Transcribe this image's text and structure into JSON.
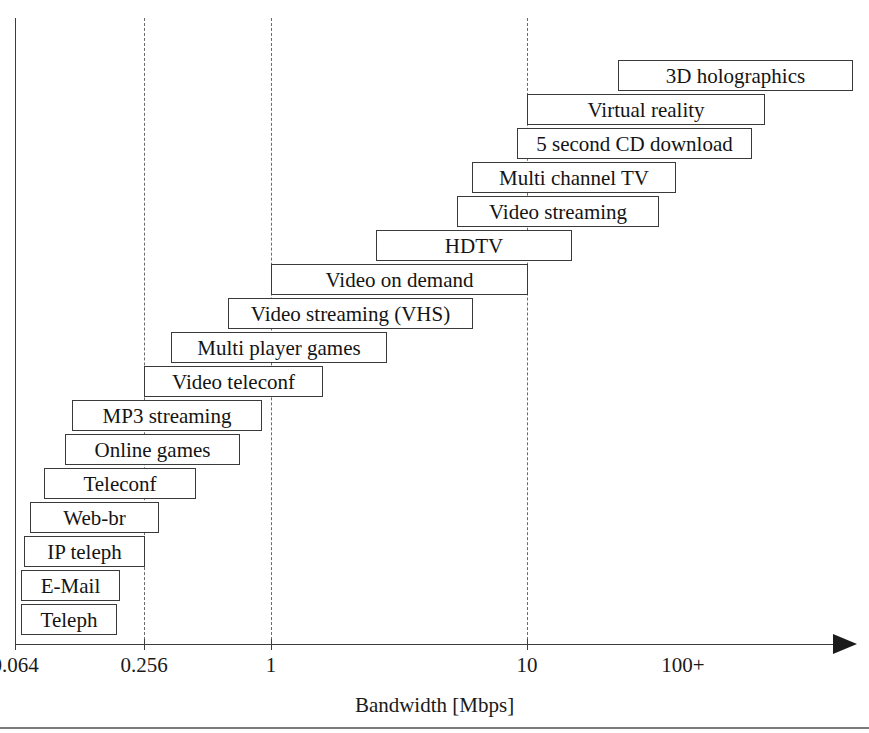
{
  "figure": {
    "title": "",
    "axis_title": "Bandwidth [Mbps]"
  },
  "axis": {
    "ticks": [
      {
        "label": "0.064",
        "x": 15,
        "gridline": false
      },
      {
        "label": "0.256",
        "x": 144,
        "gridline": true
      },
      {
        "label": "1",
        "x": 271,
        "gridline": true
      },
      {
        "label": "10",
        "x": 527,
        "gridline": true
      },
      {
        "label": "100+",
        "x": 683,
        "gridline": false
      }
    ]
  },
  "chart_data": {
    "type": "bar",
    "orientation": "horizontal-range",
    "title": "",
    "xlabel": "Bandwidth [Mbps]",
    "ylabel": "",
    "xscale": "log-categorical",
    "xticks": [
      "0.064",
      "0.256",
      "1",
      "10",
      "100+"
    ],
    "grid": "vertical-dashed at 0.256, 1, 10",
    "legend": "none",
    "categories": [
      "3D holographics",
      "Virtual reality",
      "5 second CD download",
      "Multi channel TV",
      "Video streaming",
      "HDTV",
      "Video on demand",
      "Video streaming (VHS)",
      "Multi player games",
      "Video teleconf",
      "MP3 streaming",
      "Online games",
      "Teleconf",
      "Web-br",
      "IP teleph",
      "E-Mail",
      "Teleph"
    ],
    "bars": [
      {
        "label": "3D holographics",
        "x": 618,
        "width": 235,
        "y": 60,
        "start_mbps": 25,
        "end_mbps": 130
      },
      {
        "label": "Virtual reality",
        "x": 527,
        "width": 238,
        "y": 94,
        "start_mbps": 10,
        "end_mbps": 60
      },
      {
        "label": "5 second CD download",
        "x": 517,
        "width": 235,
        "y": 128,
        "start_mbps": 9,
        "end_mbps": 50
      },
      {
        "label": "Multi channel TV",
        "x": 472,
        "width": 204,
        "y": 162,
        "start_mbps": 6,
        "end_mbps": 27
      },
      {
        "label": "Video streaming",
        "x": 457,
        "width": 202,
        "y": 196,
        "start_mbps": 5,
        "end_mbps": 23
      },
      {
        "label": "HDTV",
        "x": 376,
        "width": 196,
        "y": 230,
        "start_mbps": 2.3,
        "end_mbps": 13
      },
      {
        "label": "Video on demand",
        "x": 271,
        "width": 257,
        "y": 264,
        "start_mbps": 1,
        "end_mbps": 10
      },
      {
        "label": "Video streaming (VHS)",
        "x": 228,
        "width": 245,
        "y": 298,
        "start_mbps": 0.7,
        "end_mbps": 6
      },
      {
        "label": "Multi player games",
        "x": 171,
        "width": 216,
        "y": 332,
        "start_mbps": 0.4,
        "end_mbps": 2.6
      },
      {
        "label": "Video teleconf",
        "x": 144,
        "width": 179,
        "y": 366,
        "start_mbps": 0.256,
        "end_mbps": 1.5
      },
      {
        "label": "MP3 streaming",
        "x": 72,
        "width": 190,
        "y": 400,
        "start_mbps": 0.11,
        "end_mbps": 0.9
      },
      {
        "label": "Online games",
        "x": 65,
        "width": 175,
        "y": 434,
        "start_mbps": 0.1,
        "end_mbps": 0.75
      },
      {
        "label": "Teleconf",
        "x": 44,
        "width": 152,
        "y": 468,
        "start_mbps": 0.08,
        "end_mbps": 0.45
      },
      {
        "label": "Web-br",
        "x": 30,
        "width": 129,
        "y": 502,
        "start_mbps": 0.07,
        "end_mbps": 0.3
      },
      {
        "label": "IP teleph",
        "x": 24,
        "width": 121,
        "y": 536,
        "start_mbps": 0.066,
        "end_mbps": 0.256
      },
      {
        "label": "E-Mail",
        "x": 21,
        "width": 99,
        "y": 570,
        "start_mbps": 0.064,
        "end_mbps": 0.17
      },
      {
        "label": "Teleph",
        "x": 21,
        "width": 96,
        "y": 604,
        "start_mbps": 0.064,
        "end_mbps": 0.16
      }
    ]
  }
}
